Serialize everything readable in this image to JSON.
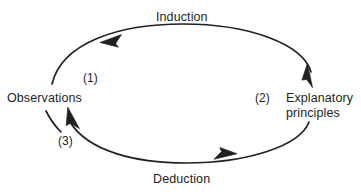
{
  "diagram": {
    "stroke_color": "#231f20",
    "text_color": "#231f20",
    "background_color": "#ffffff",
    "nodes": [
      {
        "id": "observations",
        "label": "Observations"
      },
      {
        "id": "explanatory_principles",
        "label": "Explanatory principles"
      }
    ],
    "edges": [
      {
        "id": "induction",
        "label": "Induction",
        "from": "observations",
        "to": "explanatory_principles",
        "direction": "clockwise"
      },
      {
        "id": "deduction",
        "label": "Deduction",
        "from": "explanatory_principles",
        "to": "observations",
        "direction": "clockwise"
      }
    ],
    "step_markers": [
      {
        "id": "step_1",
        "label": "(1)"
      },
      {
        "id": "step_2",
        "label": "(2)"
      },
      {
        "id": "step_3",
        "label": "(3)"
      }
    ],
    "labels": {
      "induction": "Induction",
      "deduction": "Deduction",
      "observations": "Observations",
      "explanatory_principles": "Explanatory principles",
      "step_1": "(1)",
      "step_2": "(2)",
      "step_3": "(3)"
    }
  }
}
